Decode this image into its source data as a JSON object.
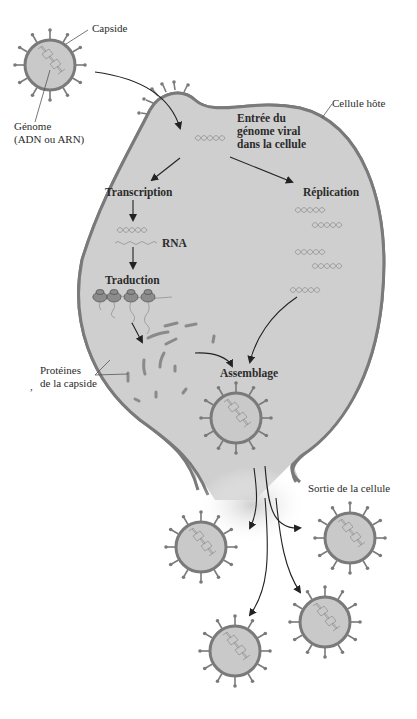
{
  "diagram": {
    "labels": {
      "capsid": "Capside",
      "genome_line1": "Génome",
      "genome_line2": "(ADN ou ARN)",
      "host_cell": "Cellule hôte",
      "entry_line1": "Entrée du",
      "entry_line2": "génome viral",
      "entry_line3": "dans la cellule",
      "transcription": "Transcription",
      "rna": "RNA",
      "translation": "Traduction",
      "replication": "Réplication",
      "proteins_line1": "Protéines",
      "proteins_line2": "de la capside",
      "assembly": "Assemblage",
      "exit": "Sortie de la cellule",
      "stray_mark": ","
    },
    "colors": {
      "cell_fill": "#cfcfcf",
      "outline": "#7a7a7a",
      "arrow": "#222222",
      "text": "#2b2b2b"
    },
    "virions": {
      "free_virus": {
        "cx": 50,
        "cy": 65
      },
      "assembled": {
        "cx": 236,
        "cy": 418
      },
      "released": [
        {
          "cx": 201,
          "cy": 547
        },
        {
          "cx": 350,
          "cy": 538
        },
        {
          "cx": 235,
          "cy": 651
        },
        {
          "cx": 325,
          "cy": 622
        }
      ]
    }
  }
}
